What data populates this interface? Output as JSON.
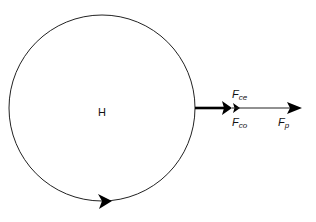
{
  "diagram": {
    "center_label": "H",
    "forces": [
      {
        "id": "ce",
        "main": "F",
        "sub": "ce"
      },
      {
        "id": "co",
        "main": "F",
        "sub": "co"
      },
      {
        "id": "p",
        "main": "F",
        "sub": "p"
      }
    ],
    "rotation_direction": "counterclockwise-bottom-left-to-right",
    "colors": {
      "stroke": "#111111",
      "background": "#ffffff"
    }
  }
}
